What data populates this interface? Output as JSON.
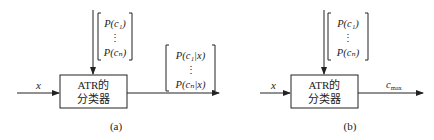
{
  "diagrams": [
    {
      "id": "a",
      "caption": "(a)",
      "input_label": "x",
      "block_line1": "ATR的",
      "block_line2": "分类器",
      "prior_vector": [
        "P(c₁)",
        "⋮",
        "P(cₙ)"
      ],
      "output_vector": [
        "P(c₁|x)",
        "⋮",
        "P(cₙ|x)"
      ]
    },
    {
      "id": "b",
      "caption": "(b)",
      "input_label": "x",
      "block_line1": "ATR的",
      "block_line2": "分类器",
      "prior_vector": [
        "P(c₁)",
        "⋮",
        "P(cₙ)"
      ],
      "output_label": "c_max",
      "output_label_main": "c",
      "output_label_sub": "max"
    }
  ]
}
